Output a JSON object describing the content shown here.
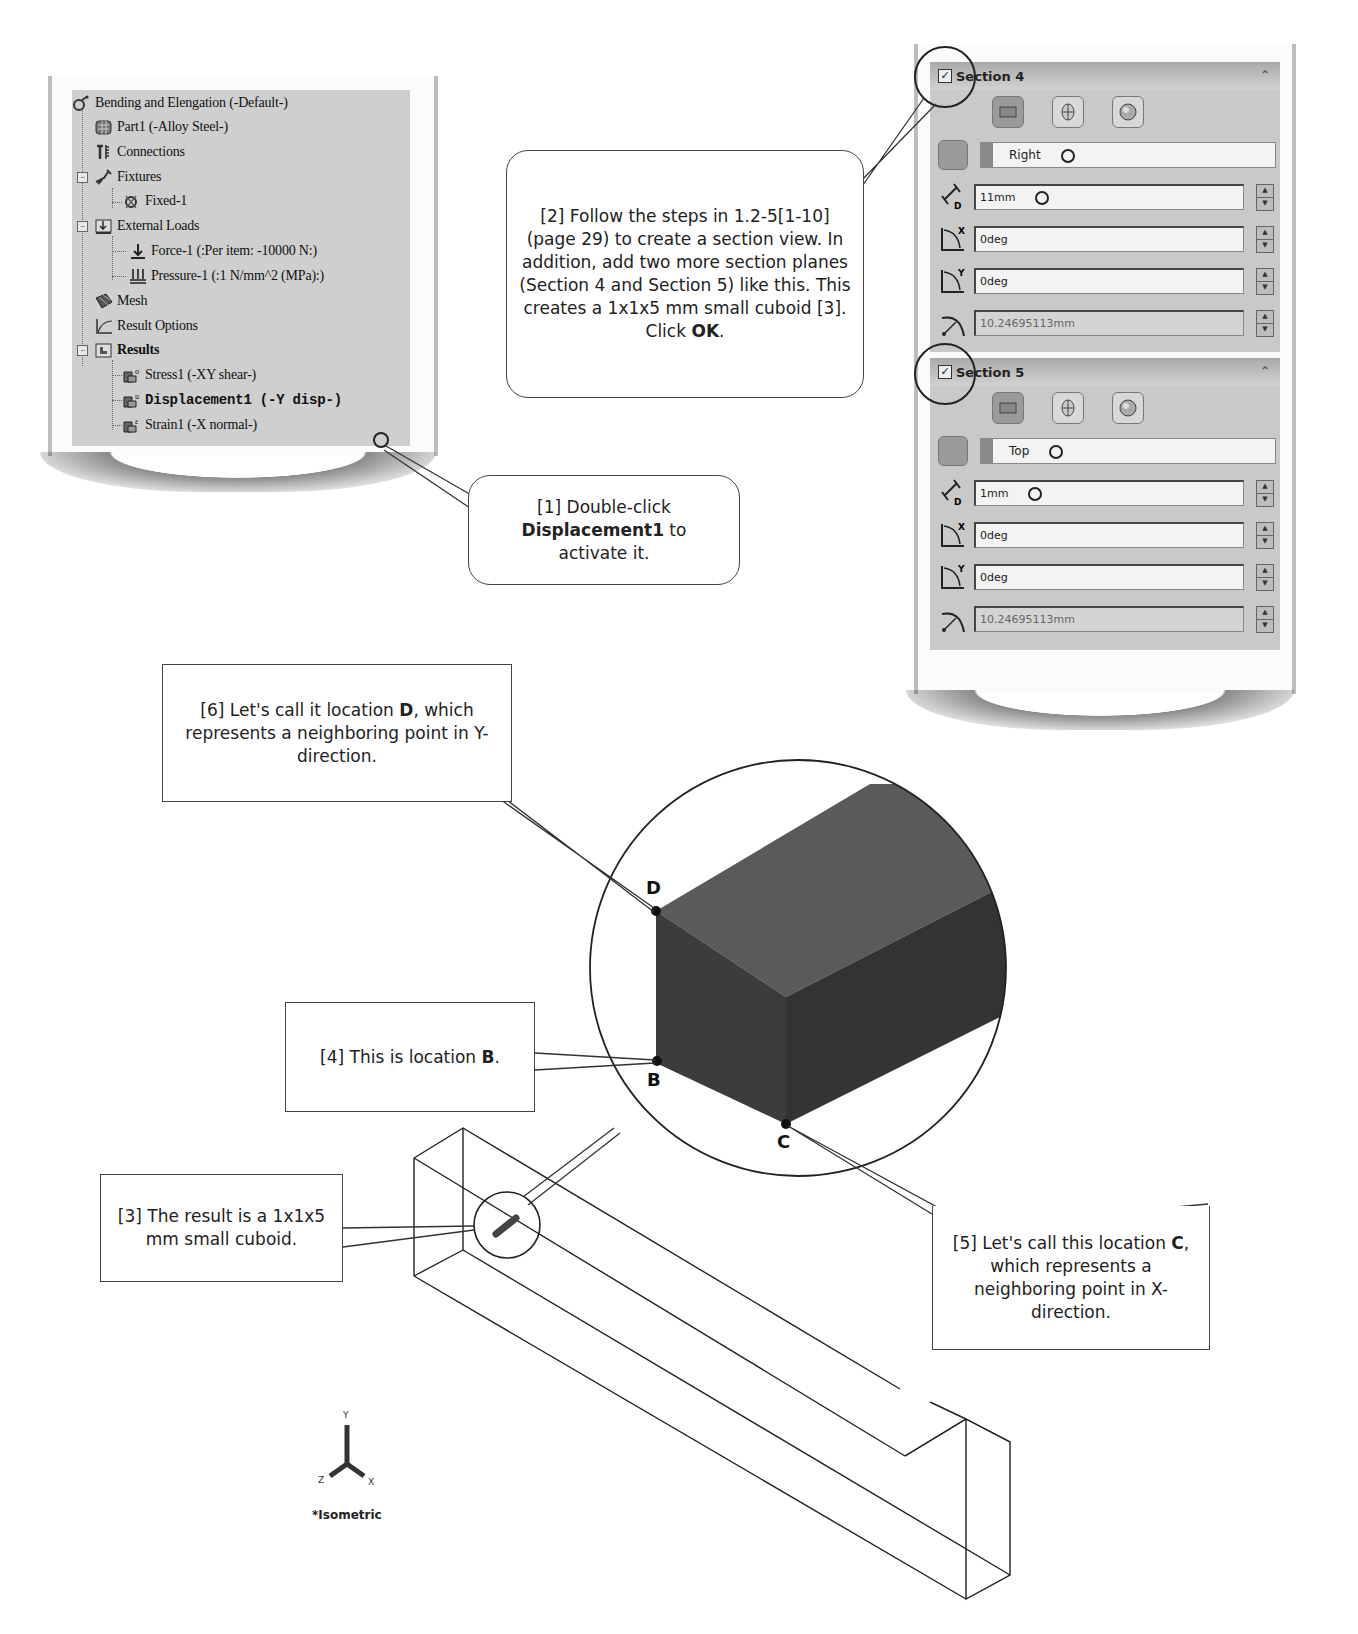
{
  "tree": {
    "items": [
      {
        "label": "Bending and Elengation (-Default-)",
        "icon": "study-icon",
        "level": 0
      },
      {
        "label": "Part1 (-Alloy Steel-)",
        "icon": "part-icon",
        "level": 1
      },
      {
        "label": "Connections",
        "icon": "connections-icon",
        "level": 1
      },
      {
        "label": "Fixtures",
        "icon": "fixtures-icon",
        "level": 1,
        "expanded": true
      },
      {
        "label": "Fixed-1",
        "icon": "fixed-icon",
        "level": 2
      },
      {
        "label": "External Loads",
        "icon": "external-loads-icon",
        "level": 1,
        "expanded": true
      },
      {
        "label": "Force-1 (:Per item: -10000 N:)",
        "icon": "force-icon",
        "level": 2
      },
      {
        "label": "Pressure-1 (:1 N/mm^2 (MPa):)",
        "icon": "pressure-icon",
        "level": 2
      },
      {
        "label": "Mesh",
        "icon": "mesh-icon",
        "level": 1
      },
      {
        "label": "Result Options",
        "icon": "result-options-icon",
        "level": 1
      },
      {
        "label": "Results",
        "icon": "results-folder-icon",
        "level": 1,
        "expanded": true,
        "bold": true
      },
      {
        "label": "Stress1 (-XY shear-)",
        "icon": "stress-plot-icon",
        "level": 2
      },
      {
        "label": "Displacement1 (-Y disp-)",
        "icon": "displacement-plot-icon",
        "level": 2,
        "bold": true
      },
      {
        "label": "Strain1 (-X normal-)",
        "icon": "strain-plot-icon",
        "level": 2
      }
    ]
  },
  "sections": [
    {
      "title": "Section 4",
      "checked": true,
      "plane": "Right",
      "offset": "11mm",
      "rot_x": "0deg",
      "rot_y": "0deg",
      "radius": "10.24695113mm"
    },
    {
      "title": "Section 5",
      "checked": true,
      "plane": "Top",
      "offset": "1mm",
      "rot_x": "0deg",
      "rot_y": "0deg",
      "radius": "10.24695113mm"
    }
  ],
  "callouts": {
    "c1": {
      "pre": "[1] Double-click",
      "bold": "Displacement1",
      "post": " to",
      "line3": "activate it."
    },
    "c2": {
      "text": "[2] Follow the steps in 1.2-5[1-10] (page 29) to create a section view.  In addition, add two more section planes (Section 4 and Section 5) like this. This creates a 1x1x5 mm small cuboid [3].  Click ",
      "bold": "OK",
      "post": "."
    },
    "c3": {
      "text": "[3] The result is a 1x1x5 mm small cuboid."
    },
    "c4": {
      "pre": "[4] This is location ",
      "bold": "B",
      "post": "."
    },
    "c5": {
      "pre": "[5] Let's call this location ",
      "bold": "C",
      "post": ", which represents a neighboring point in X-direction."
    },
    "c6": {
      "pre": "[6] Let's call it location ",
      "bold": "D",
      "post": ", which represents a neighboring point in Y-direction."
    }
  },
  "points": {
    "b": "B",
    "c": "C",
    "d": "D"
  },
  "triad": {
    "x": "X",
    "y": "Y",
    "z": "Z"
  },
  "view_label": "*Isometric"
}
